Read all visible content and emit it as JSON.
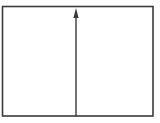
{
  "diagram": {
    "stroke_color": "#3a3a3a",
    "background": "#ffffff",
    "frame": {
      "x": 2.5,
      "y": 6.5,
      "width": 150.5,
      "height": 109.5,
      "stroke_width": 1.6
    },
    "arrow": {
      "direction": "up",
      "x": 76,
      "y_start": 116,
      "y_end": 18,
      "head": {
        "tip_y": 8,
        "base_y": 18,
        "half_width": 2.6
      },
      "stroke_width": 1.4
    }
  }
}
